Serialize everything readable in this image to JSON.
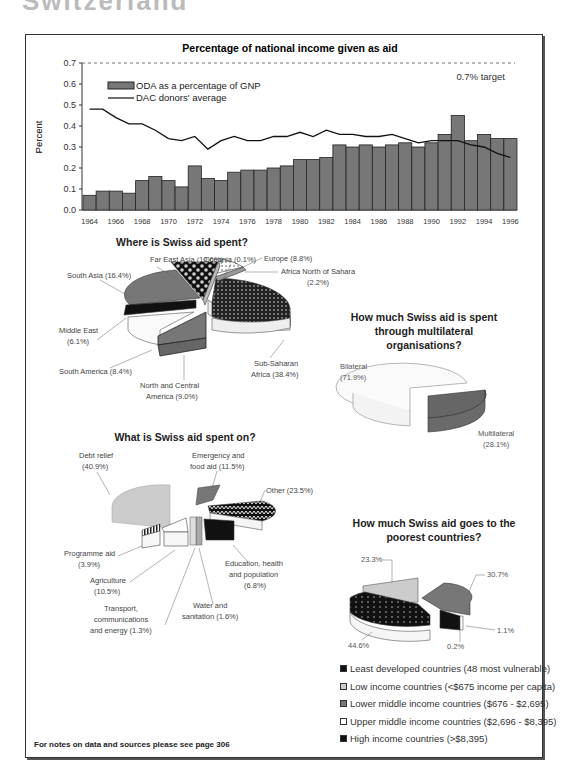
{
  "page": {
    "heading_cut": "Switzerland",
    "footer_note": "For notes on data and sources please see page 306"
  },
  "chart_data": [
    {
      "type": "bar",
      "title": "Percentage of national income given as aid",
      "xlabel": "",
      "ylabel": "Percent",
      "ylim": [
        0,
        0.7
      ],
      "yticks": [
        "0.0",
        "0.1",
        "0.2",
        "0.3",
        "0.4",
        "0.5",
        "0.6",
        "0.7"
      ],
      "xtick_labels": [
        "1964",
        "1966",
        "1968",
        "1970",
        "1972",
        "1974",
        "1976",
        "1978",
        "1980",
        "1982",
        "1984",
        "1986",
        "1988",
        "1990",
        "1992",
        "1994",
        "1996"
      ],
      "categories": [
        1964,
        1965,
        1966,
        1967,
        1968,
        1969,
        1970,
        1971,
        1972,
        1973,
        1974,
        1975,
        1976,
        1977,
        1978,
        1979,
        1980,
        1981,
        1982,
        1983,
        1984,
        1985,
        1986,
        1987,
        1988,
        1989,
        1990,
        1991,
        1992,
        1993,
        1994,
        1995,
        1996
      ],
      "series": [
        {
          "name": "ODA as a percentage of GNP",
          "type": "bar",
          "values": [
            0.07,
            0.09,
            0.09,
            0.08,
            0.14,
            0.16,
            0.14,
            0.11,
            0.21,
            0.15,
            0.14,
            0.18,
            0.19,
            0.19,
            0.2,
            0.21,
            0.24,
            0.24,
            0.25,
            0.31,
            0.3,
            0.31,
            0.3,
            0.31,
            0.32,
            0.3,
            0.32,
            0.36,
            0.45,
            0.33,
            0.36,
            0.34,
            0.34
          ]
        },
        {
          "name": "DAC donors' average",
          "type": "line",
          "values": [
            0.48,
            0.48,
            0.44,
            0.41,
            0.41,
            0.38,
            0.34,
            0.33,
            0.35,
            0.29,
            0.33,
            0.35,
            0.33,
            0.33,
            0.35,
            0.35,
            0.37,
            0.35,
            0.38,
            0.36,
            0.36,
            0.35,
            0.35,
            0.36,
            0.34,
            0.32,
            0.33,
            0.33,
            0.33,
            0.31,
            0.3,
            0.27,
            0.25
          ]
        }
      ],
      "annotations": [
        {
          "text": "0.7% target",
          "y": 0.7,
          "style": "dashed"
        }
      ],
      "legend_position": "upper left",
      "grid": false
    },
    {
      "type": "pie",
      "title": "Where is Swiss aid spent?",
      "labels": [
        "Sub-Saharan Africa",
        "South Asia",
        "Far East Asia",
        "North and Central America",
        "Europe",
        "South America",
        "Middle East",
        "Africa North of Sahara",
        "Oceania"
      ],
      "display_labels": [
        "Sub-Saharan Africa (38.4%)",
        "South Asia (16.4%)",
        "Far East Asia (10.6%)",
        "North and Central America (9.0%)",
        "Europe (8.8%)",
        "South America (8.4%)",
        "Middle East (6.1%)",
        "Africa North of Sahara (2.2%)",
        "Oceania (0.1%)"
      ],
      "values": [
        38.4,
        16.4,
        10.6,
        9.0,
        8.8,
        8.4,
        6.1,
        2.2,
        0.1
      ]
    },
    {
      "type": "pie",
      "title": "How much Swiss aid is spent through multilateral organisations?",
      "labels": [
        "Bilateral",
        "Multilateral"
      ],
      "display_labels": [
        "Bilateral (71.9%)",
        "Multilateral (28.1%)"
      ],
      "values": [
        71.9,
        28.1
      ]
    },
    {
      "type": "pie",
      "title": "What is Swiss aid spent on?",
      "labels": [
        "Debt relief",
        "Other",
        "Emergency and food aid",
        "Agriculture",
        "Education, health and population",
        "Programme aid",
        "Water and sanitation",
        "Transport, communications and energy"
      ],
      "display_labels": [
        "Debt relief (40.9%)",
        "Other (23.5%)",
        "Emergency and food aid (11.5%)",
        "Agriculture (10.5%)",
        "Education, health and population (6.8%)",
        "Programme aid (3.9%)",
        "Water and sanitation (1.6%)",
        "Transport, communications and energy (1.3%)"
      ],
      "values": [
        40.9,
        23.5,
        11.5,
        10.5,
        6.8,
        3.9,
        1.6,
        1.3
      ]
    },
    {
      "type": "pie",
      "title": "How much Swiss aid goes to the poorest countries?",
      "labels": [
        "Least developed countries (48 most vulnerable)",
        "Low income countries (<$675 income per capita)",
        "Lower middle income countries ($676 - $2,695)",
        "Upper middle income countries ($2,696 - $8,395)",
        "High income countries (>$8,395)"
      ],
      "values": [
        44.6,
        23.3,
        30.7,
        1.1,
        0.2
      ],
      "display_labels": [
        "44.6%",
        "23.3%",
        "30.7%",
        "1.1%",
        "0.2%"
      ],
      "legend_position": "below"
    }
  ],
  "bar_chart": {
    "title": "Percentage of national income given as aid",
    "ylabel": "Percent",
    "legend_bar": "ODA as a percentage of GNP",
    "legend_line": "DAC donors' average",
    "target_label": "0.7% target"
  },
  "region_pie": {
    "title": "Where is Swiss aid spent?",
    "labels": {
      "far_east": "Far East Asia (10.6%)",
      "oceania": "Oceania (0.1%)",
      "europe": "Europe (8.8%)",
      "africa_north_1": "Africa North of Sahara",
      "africa_north_2": "(2.2%)",
      "south_asia": "South Asia (16.4%)",
      "middle_east_1": "Middle East",
      "middle_east_2": "(6.1%)",
      "south_america": "South America (8.4%)",
      "nca_1": "North and Central",
      "nca_2": "America (9.0%)",
      "ssa_1": "Sub-Saharan",
      "ssa_2": "Africa (38.4%)"
    }
  },
  "multi_pie": {
    "title_1": "How much Swiss aid is spent",
    "title_2": "through multilateral",
    "title_3": "organisations?",
    "bilateral_1": "Bilateral",
    "bilateral_2": "(71.9%)",
    "multilateral_1": "Multilateral",
    "multilateral_2": "(28.1%)"
  },
  "sector_pie": {
    "title": "What is Swiss aid spent on?",
    "labels": {
      "debt_1": "Debt relief",
      "debt_2": "(40.9%)",
      "emerg_1": "Emergency and",
      "emerg_2": "food aid (11.5%)",
      "other": "Other (23.5%)",
      "prog_1": "Programme aid",
      "prog_2": "(3.9%)",
      "agri_1": "Agriculture",
      "agri_2": "(10.5%)",
      "edu_1": "Education, health",
      "edu_2": "and population",
      "edu_3": "(6.8%)",
      "trans_1": "Transport,",
      "trans_2": "communications",
      "trans_3": "and energy (1.3%)",
      "water_1": "Water and",
      "water_2": "sanitation (1.6%)"
    }
  },
  "poor_pie": {
    "title_1": "How much Swiss aid goes to the",
    "title_2": "poorest countries?",
    "labels": {
      "low": "23.3%",
      "lower_mid": "30.7%",
      "upper_mid": "1.1%",
      "high": "0.2%",
      "ldc": "44.6%"
    },
    "legend": [
      {
        "label": "Least developed countries (48 most vulnerable)",
        "color": "#111111"
      },
      {
        "label": "Low income countries (<$675 income per capita)",
        "color": "#cccccc"
      },
      {
        "label": "Lower middle income countries ($676 - $2,695)",
        "color": "#777777"
      },
      {
        "label": "Upper middle income countries ($2,696 - $8,395)",
        "color": "#ffffff"
      },
      {
        "label": "High income countries (>$8,395)",
        "color": "#111111"
      }
    ]
  }
}
